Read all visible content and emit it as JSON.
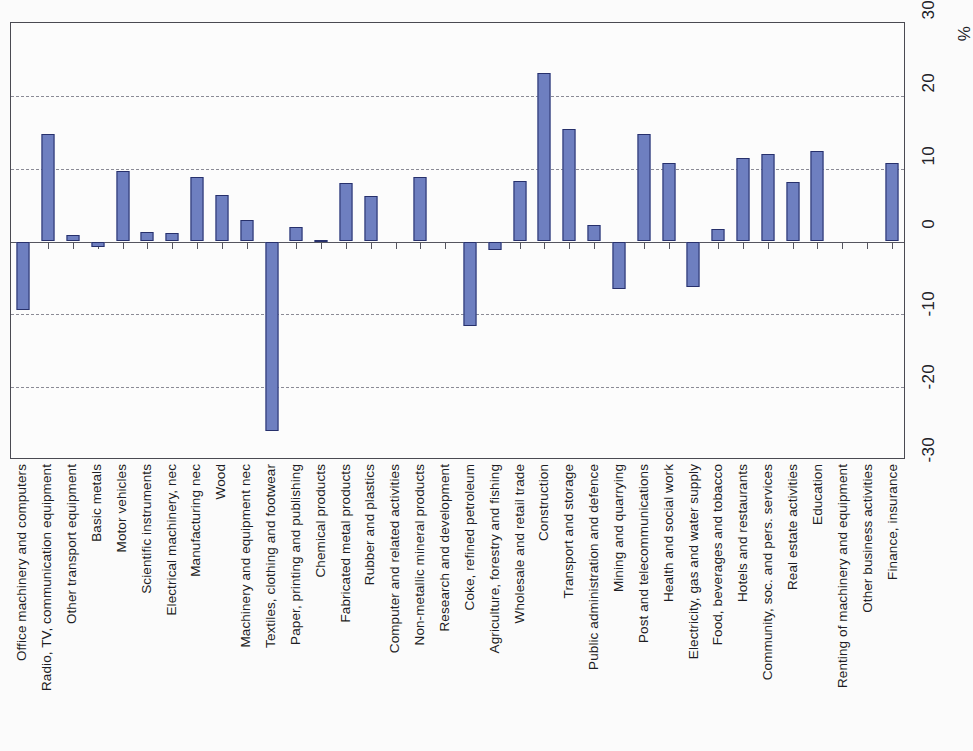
{
  "chart_data": {
    "type": "bar",
    "title": "",
    "xlabel": "",
    "ylabel": "%",
    "unit": "%",
    "ylim": [
      -30,
      30
    ],
    "ytick_labels": [
      "30",
      "20",
      "10",
      "0",
      "-10",
      "-20",
      "-30"
    ],
    "yticks": [
      30,
      20,
      10,
      0,
      -10,
      -20,
      -30
    ],
    "gridlines": [
      20,
      10,
      -10,
      -20
    ],
    "grid": true,
    "legend": "none",
    "bar_color": "#6e7fc0",
    "bar_border_color": "#27306b",
    "categories": [
      "Office machinery and computers",
      "Radio, TV, communication equipment",
      "Other transport equipment",
      "Basic metals",
      "Motor vehicles",
      "Scientific instruments",
      "Electrical machinery, nec",
      "Manufacturing nec",
      "Wood",
      "Machinery and equipment nec",
      "Textiles, clothing and footwear",
      "Paper, printing and publishing",
      "Chemical products",
      "Fabricated metal products",
      "Rubber and plastics",
      "Computer and related activities",
      "Non-metallic mineral products",
      "Research and development",
      "Coke, refined petroleum",
      "Agriculture, forestry and fishing",
      "Wholesale and retail trade",
      "Construction",
      "Transport and storage",
      "Public administration and defence",
      "Mining and quarrying",
      "Post and telecommunications",
      "Health and social work",
      "Electricity, gas and water supply",
      "Food, beverages and tobacco",
      "Hotels and restaurants",
      "Community, soc. and pers. services",
      "Real estate activities",
      "Education",
      "Renting of machinery and equipment",
      "Other business activities",
      "Finance, insurance"
    ],
    "values": [
      -9.4,
      14.8,
      0.9,
      -0.8,
      9.7,
      1.3,
      1.1,
      8.8,
      6.4,
      3.0,
      -26.0,
      2.0,
      0.2,
      8.0,
      6.2,
      0.0,
      8.8,
      0.0,
      -11.6,
      -1.2,
      8.3,
      23.2,
      15.5,
      2.3,
      -6.5,
      14.8,
      10.8,
      -6.2,
      1.7,
      11.5,
      12.0,
      8.2,
      12.4,
      0.0,
      0.0,
      10.8
    ]
  }
}
